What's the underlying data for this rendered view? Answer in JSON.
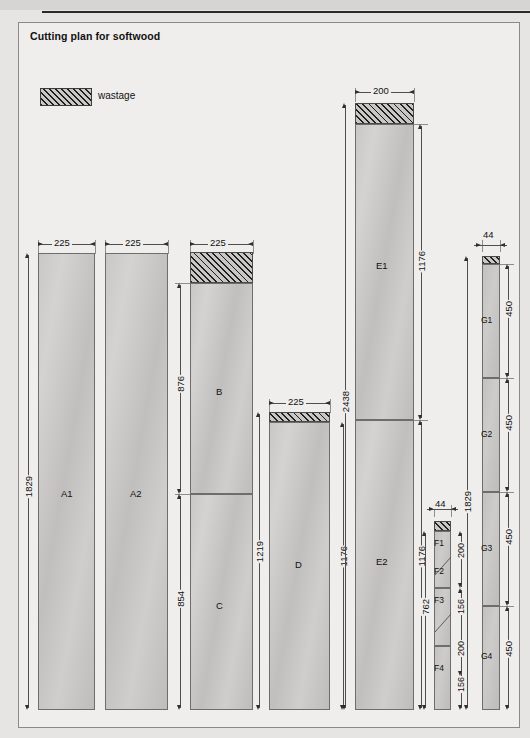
{
  "title": "Cutting plan for softwood",
  "legend": {
    "label": "wastage",
    "swatch": "hatched"
  },
  "colors": {
    "hatch": "#1f1f1f",
    "board": "#c9c8c6",
    "line": "#4f4f4d",
    "frame": "#8a8a88"
  },
  "columns": [
    {
      "id": "col-a1",
      "width_label": "225",
      "pieces": [
        {
          "label": "A1",
          "kind": "piece"
        }
      ],
      "dimensions": [
        {
          "value": "1829",
          "orientation": "vertical",
          "side": "left"
        }
      ]
    },
    {
      "id": "col-a2",
      "width_label": "225",
      "pieces": [
        {
          "label": "A2",
          "kind": "piece"
        }
      ],
      "dimensions": []
    },
    {
      "id": "col-bc",
      "width_label": "225",
      "pieces": [
        {
          "label": "",
          "kind": "wastage"
        },
        {
          "label": "B",
          "kind": "piece"
        },
        {
          "label": "C",
          "kind": "piece"
        }
      ],
      "dimensions": [
        {
          "value": "876",
          "orientation": "vertical",
          "side": "left"
        },
        {
          "value": "854",
          "orientation": "vertical",
          "side": "left"
        }
      ]
    },
    {
      "id": "col-d",
      "width_label": "225",
      "pieces": [
        {
          "label": "",
          "kind": "wastage"
        },
        {
          "label": "D",
          "kind": "piece"
        }
      ],
      "dimensions": [
        {
          "value": "1219",
          "orientation": "vertical",
          "side": "left"
        },
        {
          "value": "1176",
          "orientation": "vertical",
          "side": "right"
        }
      ]
    },
    {
      "id": "col-e",
      "width_label": "200",
      "pieces": [
        {
          "label": "",
          "kind": "wastage"
        },
        {
          "label": "E1",
          "kind": "piece"
        },
        {
          "label": "E2",
          "kind": "piece"
        }
      ],
      "dimensions": [
        {
          "value": "2438",
          "orientation": "vertical",
          "side": "left"
        },
        {
          "value": "1176",
          "orientation": "vertical",
          "side": "right"
        },
        {
          "value": "1176",
          "orientation": "vertical",
          "side": "right"
        }
      ]
    },
    {
      "id": "col-f",
      "width_label": "44",
      "pieces": [
        {
          "label": "",
          "kind": "wastage"
        },
        {
          "label": "F1",
          "kind": "piece"
        },
        {
          "label": "F2",
          "kind": "piece"
        },
        {
          "label": "F3",
          "kind": "piece"
        },
        {
          "label": "F4",
          "kind": "piece"
        }
      ],
      "dimensions": [
        {
          "value": "762",
          "orientation": "vertical",
          "side": "left"
        },
        {
          "value": "200",
          "orientation": "vertical",
          "side": "right"
        },
        {
          "value": "156",
          "orientation": "vertical",
          "side": "right"
        },
        {
          "value": "200",
          "orientation": "vertical",
          "side": "right"
        },
        {
          "value": "156",
          "orientation": "vertical",
          "side": "right"
        }
      ]
    },
    {
      "id": "col-g",
      "width_label": "44",
      "pieces": [
        {
          "label": "",
          "kind": "wastage"
        },
        {
          "label": "G1",
          "kind": "piece"
        },
        {
          "label": "G2",
          "kind": "piece"
        },
        {
          "label": "G3",
          "kind": "piece"
        },
        {
          "label": "G4",
          "kind": "piece"
        }
      ],
      "dimensions": [
        {
          "value": "1829",
          "orientation": "vertical",
          "side": "left"
        },
        {
          "value": "450",
          "orientation": "vertical",
          "side": "right"
        },
        {
          "value": "450",
          "orientation": "vertical",
          "side": "right"
        },
        {
          "value": "450",
          "orientation": "vertical",
          "side": "right"
        },
        {
          "value": "450",
          "orientation": "vertical",
          "side": "right"
        }
      ]
    }
  ],
  "labels": {
    "w225_a1": "225",
    "w225_a2": "225",
    "w225_bc": "225",
    "w225_d": "225",
    "w200_e": "200",
    "w44_f": "44",
    "w44_g": "44",
    "v1829_a": "1829",
    "v876": "876",
    "v854": "854",
    "v1219": "1219",
    "v1176_d": "1176",
    "v2438": "2438",
    "v1176_e1": "1176",
    "v1176_e2": "1176",
    "v762": "762",
    "v200_f1": "200",
    "v156_f2": "156",
    "v200_f3": "200",
    "v156_f4": "156",
    "v1829_g": "1829",
    "v450_g1": "450",
    "v450_g2": "450",
    "v450_g3": "450",
    "v450_g4": "450",
    "pA1": "A1",
    "pA2": "A2",
    "pB": "B",
    "pC": "C",
    "pD": "D",
    "pE1": "E1",
    "pE2": "E2",
    "pF1": "F1",
    "pF2": "F2",
    "pF3": "F3",
    "pF4": "F4",
    "pG1": "G1",
    "pG2": "G2",
    "pG3": "G3",
    "pG4": "G4"
  }
}
